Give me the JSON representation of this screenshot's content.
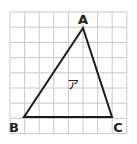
{
  "diagram": {
    "grid": {
      "x0": 10,
      "y0": 12,
      "cols": 8,
      "rows": 8,
      "cell_w": 14.6,
      "cell_h": 15.2,
      "line_color": "#c8c8c8"
    },
    "triangle": {
      "name": "ア",
      "stroke": "#1a1a1a",
      "vertices": {
        "A": {
          "label": "A",
          "x": 83,
          "y": 28
        },
        "B": {
          "label": "B",
          "x": 24,
          "y": 117
        },
        "C": {
          "label": "C",
          "x": 112,
          "y": 117
        }
      }
    },
    "labels": {
      "A": "A",
      "B": "B",
      "C": "C",
      "region": "ア"
    }
  }
}
